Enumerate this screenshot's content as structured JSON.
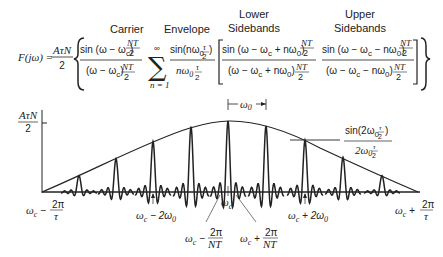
{
  "equation": {
    "lhs": "F(jω) =",
    "coef_num": "AτN",
    "coef_den": "2",
    "terms": [
      {
        "label": "Carrier",
        "num": "sin (ω − ω",
        "num_sub": "c",
        "num_tail": ")",
        "num_frac_n": "NT",
        "num_frac_d": "2",
        "den": "(ω − ω",
        "den_sub": "c",
        "den_tail": ")",
        "den_frac_n": "NT",
        "den_frac_d": "2"
      },
      {
        "label": "Envelope",
        "sum_top": "∞",
        "sum_bottom": "n = 1",
        "num": "sin(nω",
        "num_sub": "0",
        "num_frac_n": "τ",
        "num_frac_d": "2",
        "num_tail": ")",
        "den": "nω",
        "den_sub": "0",
        "den_frac_n": "τ",
        "den_frac_d": "2"
      },
      {
        "label_line1": "Lower",
        "label_line2": "Sidebands",
        "num": "sin (ω − ω",
        "num_sub": "c",
        "num_mid": " + nω",
        "num_sub2": "0",
        "num_tail": ")",
        "num_frac_n": "NT",
        "num_frac_d": "2",
        "den": "(ω − ω",
        "den_sub": "c",
        "den_mid": " + nω",
        "den_sub2": "0",
        "den_tail": ")",
        "den_frac_n": "NT",
        "den_frac_d": "2"
      },
      {
        "label_line1": "Upper",
        "label_line2": "Sidebands",
        "num": "sin (ω − ω",
        "num_sub": "c",
        "num_mid": " − nω",
        "num_sub2": "0",
        "num_tail": ")",
        "num_frac_n": "NT",
        "num_frac_d": "2",
        "den": "(ω − ω",
        "den_sub": "c",
        "den_mid": " − nω",
        "den_sub2": "0",
        "den_tail": ")",
        "den_frac_n": "NT",
        "den_frac_d": "2"
      }
    ]
  },
  "plot": {
    "y_label_num": "AτN",
    "y_label_den": "2",
    "spacing_label": "ω",
    "spacing_label_sub": "0",
    "envelope_annotation": {
      "num": "sin(2ω",
      "num_sub": "0",
      "num_frac_n": "τ",
      "num_frac_d": "2",
      "num_tail": ")",
      "den": "2ω",
      "den_sub": "0",
      "den_frac_n": "τ",
      "den_frac_d": "2"
    },
    "x_labels": {
      "left_end": {
        "text": "ω",
        "sub": "c",
        "op": " − ",
        "frac_n": "2π",
        "frac_d": "τ"
      },
      "minus_2w0": {
        "text": "ω",
        "sub": "c",
        "tail": " − 2ω",
        "sub2": "0"
      },
      "minus_2pi_nt": {
        "text": "ω",
        "sub": "c",
        "op": " − ",
        "frac_n": "2π",
        "frac_d": "NT"
      },
      "center": {
        "text": "ω",
        "sub": "c"
      },
      "plus_2pi_nt": {
        "text": "ω",
        "sub": "c",
        "op": " + ",
        "frac_n": "2π",
        "frac_d": "NT"
      },
      "plus_2w0": {
        "text": "ω",
        "sub": "c",
        "tail": " + 2ω",
        "sub2": "0"
      },
      "right_end": {
        "text": "ω",
        "sub": "c",
        "op": " + ",
        "frac_n": "2π",
        "frac_d": "τ"
      }
    }
  },
  "chart_data": {
    "type": "line",
    "xlabel": "ω",
    "ylabel": "F(jω)",
    "x": [
      "ωc−2π/τ",
      "ωc−4ω0",
      "ωc−3ω0",
      "ωc−2ω0",
      "ωc−ω0",
      "ωc",
      "ωc+ω0",
      "ωc+2ω0",
      "ωc+3ω0",
      "ωc+4ω0",
      "ωc+2π/τ"
    ],
    "series": [
      {
        "name": "Envelope (sin x / x)",
        "values": [
          0,
          0.23,
          0.47,
          0.72,
          0.91,
          1.0,
          0.93,
          0.73,
          0.49,
          0.23,
          0
        ]
      },
      {
        "name": "Spectral line peaks",
        "values": [
          null,
          0.23,
          0.47,
          0.71,
          0.92,
          1.0,
          0.93,
          0.73,
          0.49,
          0.23,
          null
        ]
      }
    ],
    "ylim": [
      0,
      1
    ],
    "y_tick_label": "AτN/2",
    "annotations": [
      "ω0 spacing",
      "sin(2ω0 τ/2)/(2ω0 τ/2)",
      "ωc−2π/NT",
      "ωc+2π/NT"
    ]
  }
}
